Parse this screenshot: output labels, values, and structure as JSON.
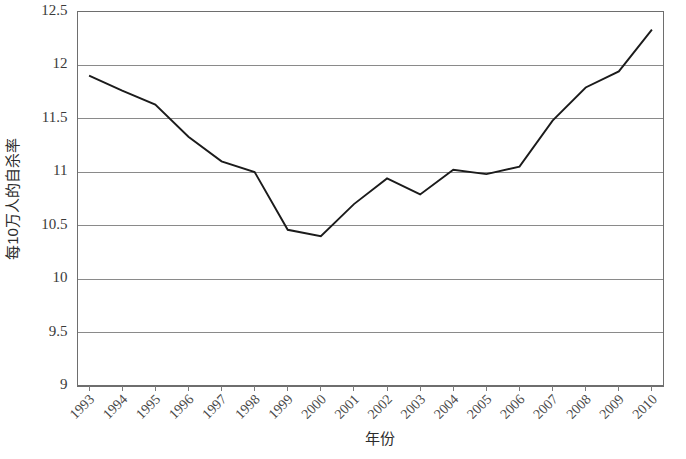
{
  "chart_data": {
    "type": "line",
    "title": "",
    "xlabel": "年份",
    "ylabel": "每10万人的自杀率",
    "x": [
      1993,
      1994,
      1995,
      1996,
      1997,
      1998,
      1999,
      2000,
      2001,
      2002,
      2003,
      2004,
      2005,
      2006,
      2007,
      2008,
      2009,
      2010
    ],
    "xtick_labels": [
      "1993",
      "1994",
      "1995",
      "1996",
      "1997",
      "1998",
      "1999",
      "2000",
      "2001",
      "2002",
      "2003",
      "2004",
      "2005",
      "2006",
      "2007",
      "2008",
      "2009",
      "2010"
    ],
    "values": [
      11.9,
      11.76,
      11.63,
      11.33,
      11.1,
      11.0,
      10.46,
      10.4,
      10.7,
      10.94,
      10.79,
      11.02,
      10.98,
      11.05,
      11.48,
      11.79,
      11.94,
      12.33
    ],
    "series": [
      {
        "name": "每10万人的自杀率",
        "values": [
          11.9,
          11.76,
          11.63,
          11.33,
          11.1,
          11.0,
          10.46,
          10.4,
          10.7,
          10.94,
          10.79,
          11.02,
          10.98,
          11.05,
          11.48,
          11.79,
          11.94,
          12.33
        ]
      }
    ],
    "ylim": [
      9,
      12.5
    ],
    "yticks": [
      9,
      9.5,
      10,
      10.5,
      11,
      11.5,
      12,
      12.5
    ],
    "ytick_labels": [
      "9",
      "9.5",
      "10",
      "10.5",
      "11",
      "11.5",
      "12",
      "12.5"
    ],
    "grid": true,
    "grid_axis": "y",
    "legend": false,
    "legend_position": "none",
    "line_color": "#1b1b1b",
    "grid_color": "#8a8a8a",
    "xtick_rotation_deg": 45,
    "markers": false
  },
  "axis": {
    "y_title": "每10万人的自杀率",
    "x_title": "年份"
  }
}
